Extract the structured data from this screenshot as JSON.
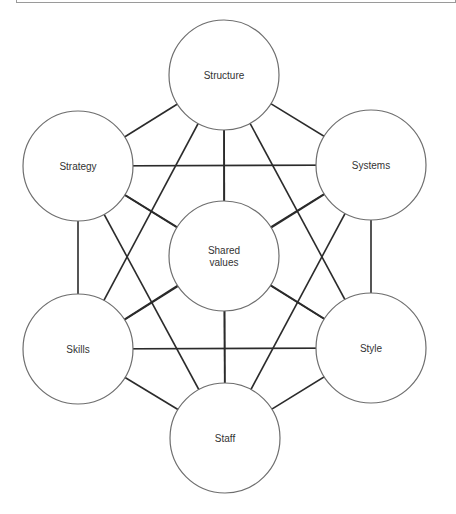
{
  "diagram": {
    "type": "network",
    "colors": {
      "line": "#2b2b2b",
      "circle_stroke": "#6e6e6e",
      "circle_fill": "#ffffff",
      "text": "#333333"
    },
    "nodes": [
      {
        "id": "structure",
        "label": [
          "Structure"
        ],
        "cx": 224,
        "cy": 75
      },
      {
        "id": "strategy",
        "label": [
          "Strategy"
        ],
        "cx": 78,
        "cy": 166
      },
      {
        "id": "systems",
        "label": [
          "Systems"
        ],
        "cx": 371,
        "cy": 165
      },
      {
        "id": "shared-values",
        "label": [
          "Shared",
          "values"
        ],
        "cx": 224,
        "cy": 256
      },
      {
        "id": "skills",
        "label": [
          "Skills"
        ],
        "cx": 78,
        "cy": 349
      },
      {
        "id": "style",
        "label": [
          "Style"
        ],
        "cx": 371,
        "cy": 348
      },
      {
        "id": "staff",
        "label": [
          "Staff"
        ],
        "cx": 225,
        "cy": 438
      }
    ],
    "radius": 55,
    "edges": "all-pairs"
  }
}
